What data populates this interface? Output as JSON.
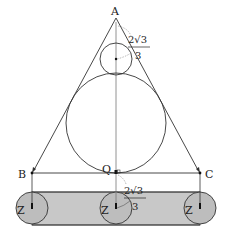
{
  "diagram": {
    "points": {
      "A": {
        "label": "A",
        "x": 116,
        "y": 18
      },
      "B": {
        "label": "B",
        "x": 32,
        "y": 173
      },
      "C": {
        "label": "C",
        "x": 200,
        "y": 173
      },
      "Q": {
        "label": "Q",
        "x": 116,
        "y": 173
      }
    },
    "circle_labels": [
      "Z",
      "Z",
      "Z"
    ],
    "annotations": {
      "top_fraction": {
        "numerator": "2√3",
        "denominator": "3"
      },
      "bottom_fraction": {
        "numerator": "2√3",
        "denominator": "3"
      }
    },
    "colors": {
      "band_fill": "#c8c8c8",
      "circle_fill": "#bdbdbd",
      "stroke": "#333333",
      "axis": "#888888"
    }
  }
}
